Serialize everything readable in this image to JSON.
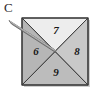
{
  "figure": {
    "panel_letter": "C",
    "background_color": "#ffffff",
    "outline_color": "#3a3a3a",
    "square": {
      "left": 22,
      "top": 18,
      "right": 88,
      "bottom": 85,
      "center_x": 55,
      "center_y": 51.5
    },
    "regions": [
      {
        "id": "left",
        "label": "6",
        "fill": "#b6b6b6",
        "position": "left-triangle"
      },
      {
        "id": "top",
        "label": "7",
        "fill": "#ededed",
        "position": "top-triangle"
      },
      {
        "id": "right",
        "label": "8",
        "fill": "#c9c9c9",
        "position": "right-triangle"
      },
      {
        "id": "bottom",
        "label": "9",
        "fill": "#bcbcbc",
        "position": "bottom-triangle"
      }
    ],
    "pointer": {
      "name": "needle",
      "tail_x": 10,
      "tail_y": 22,
      "tip_x": 55,
      "tip_y": 52,
      "fill": "#9a9a9a",
      "stroke": "#5d5d5d"
    }
  }
}
